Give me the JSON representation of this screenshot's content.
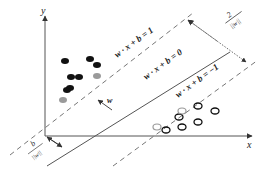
{
  "axes": {
    "x_label": "x",
    "y_label": "y"
  },
  "hyperplanes": {
    "positive_margin": "w · x + b = 1",
    "decision_boundary": "w · x + b = 0",
    "negative_margin": "w · x + b = −1"
  },
  "annotations": {
    "normal_vector": "w",
    "margin_width_num": "2",
    "margin_width_den": "||w||",
    "offset_num": "b",
    "offset_den": "||w||"
  },
  "points": {
    "positive_class": [
      [
        58,
        75
      ],
      [
        80,
        69
      ],
      [
        86,
        82
      ],
      [
        71,
        92
      ],
      [
        79,
        92
      ],
      [
        73,
        110
      ],
      [
        77,
        107
      ]
    ],
    "positive_support_vectors": [
      [
        97,
        78
      ],
      [
        65,
        125
      ]
    ],
    "negative_class": [
      [
        199,
        107
      ],
      [
        216,
        111
      ],
      [
        178,
        118
      ],
      [
        198,
        121
      ],
      [
        182,
        127
      ],
      [
        166,
        130
      ]
    ],
    "negative_support_vectors": [
      [
        182,
        112
      ],
      [
        157,
        128
      ]
    ]
  },
  "colors": {
    "line": "#444444",
    "point_filled": "#111111",
    "support_vector": "#9a9a9a",
    "background": "#ffffff"
  }
}
